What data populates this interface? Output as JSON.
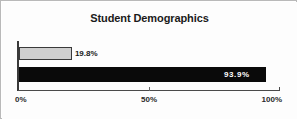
{
  "chart_data": {
    "type": "bar",
    "orientation": "horizontal",
    "title": "Student Demographics",
    "xlabel": "",
    "ylabel": "",
    "categories": [
      "",
      ""
    ],
    "values": [
      19.8,
      93.9
    ],
    "data_labels": [
      "19.8%",
      "93.9%"
    ],
    "xlim": [
      0,
      100
    ],
    "xticks": [
      0,
      50,
      100
    ],
    "xtick_labels": [
      "0%",
      "50%",
      "100%"
    ],
    "grid": false,
    "legend": null,
    "series": [
      {
        "name": "",
        "values": [
          19.8,
          93.9
        ],
        "labels": [
          "19.8%",
          "93.9%"
        ],
        "colors": [
          "#cfcfcf",
          "#0a0a0a"
        ]
      }
    ],
    "bar_styles": [
      {
        "fill": "#cfcfcf",
        "border": "#3a3a3a",
        "label_position": "outside",
        "label_color": "#1a1a1a"
      },
      {
        "fill": "#0a0a0a",
        "border": "#0a0a0a",
        "label_position": "inside",
        "label_color": "#ffffff"
      }
    ]
  },
  "colors": {
    "frame_border": "#b9b9b9",
    "plot_background": "#fdfdfd",
    "axis_line": "#4a4a4a",
    "title_text": "#1a1a1a",
    "tick_text": "#2a2a2a"
  }
}
